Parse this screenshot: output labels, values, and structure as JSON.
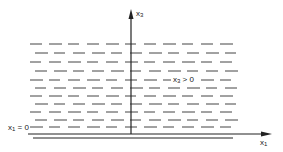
{
  "diagram": {
    "axes": {
      "vertical": {
        "label_var": "x",
        "label_sub": "3"
      },
      "horizontal": {
        "label_var": "x",
        "label_sub": "1"
      }
    },
    "boundary_label": {
      "var": "x",
      "sub": "1",
      "rest": " = 0"
    },
    "region_label": {
      "var": "x",
      "sub": "3",
      "rest": " > 0"
    },
    "colors": {
      "line": "#222222",
      "dash": "#444444",
      "background": "#ffffff"
    },
    "dash_rows_y": [
      44,
      53,
      62,
      71,
      80,
      88,
      96,
      104,
      112,
      120,
      127
    ]
  }
}
